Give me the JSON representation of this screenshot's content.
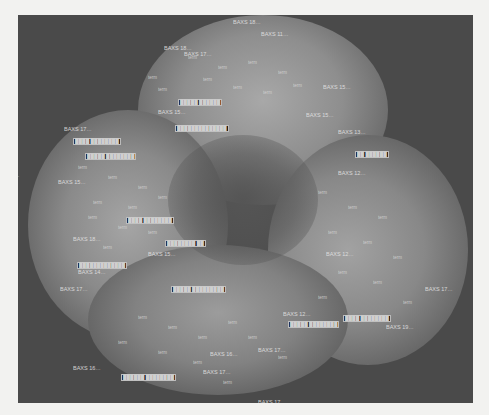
{
  "map": {
    "note": "Density/term map. Label text is illegible at this resolution; strings below are approximate placeholders following the visible 'BAXS …' pattern, not verified transcriptions.",
    "colors": {
      "background": "#4a4a4a",
      "page": "#f2f2f0",
      "cloud": "#8a8a8a",
      "label": "#d8d8d8"
    },
    "labels": [
      {
        "t": "BAXS 18…",
        "x": 215,
        "y": 5,
        "big": true
      },
      {
        "t": "BAXS 11…",
        "x": 243,
        "y": 17,
        "big": true
      },
      {
        "t": "BAXS 18…",
        "x": 146,
        "y": 31,
        "big": true
      },
      {
        "t": "BAXS 17…",
        "x": 166,
        "y": 37,
        "big": true
      },
      {
        "t": "BAXS 17…",
        "x": 46,
        "y": 112,
        "big": true
      },
      {
        "t": "BAXS 15…",
        "x": 140,
        "y": 95,
        "big": true
      },
      {
        "t": "BAXS 15…",
        "x": 305,
        "y": 70,
        "big": true
      },
      {
        "t": "BAXS 15…",
        "x": 288,
        "y": 98,
        "big": true
      },
      {
        "t": "BAXS 13…",
        "x": 320,
        "y": 115,
        "big": true
      },
      {
        "t": "BAXS 12…",
        "x": 320,
        "y": 156,
        "big": true
      },
      {
        "t": "…",
        "x": -4,
        "y": 158,
        "big": true
      },
      {
        "t": "BAXS 15…",
        "x": 40,
        "y": 165,
        "big": true
      },
      {
        "t": "BAXS 18…",
        "x": 55,
        "y": 222,
        "big": true
      },
      {
        "t": "BAXS 15…",
        "x": 130,
        "y": 237,
        "big": true
      },
      {
        "t": "BAXS 14…",
        "x": 60,
        "y": 255,
        "big": true
      },
      {
        "t": "BAXS 17…",
        "x": 42,
        "y": 272,
        "big": true
      },
      {
        "t": "BAXS 12…",
        "x": 308,
        "y": 237,
        "big": true
      },
      {
        "t": "BAXS 12…",
        "x": 265,
        "y": 297,
        "big": true
      },
      {
        "t": "BAXS 19…",
        "x": 368,
        "y": 310,
        "big": true
      },
      {
        "t": "BAXS 17…",
        "x": 407,
        "y": 272,
        "big": true
      },
      {
        "t": "BAXS 16…",
        "x": 55,
        "y": 351,
        "big": true
      },
      {
        "t": "BAXS 16…",
        "x": 192,
        "y": 337,
        "big": true
      },
      {
        "t": "BAXS 17…",
        "x": 185,
        "y": 355,
        "big": true
      },
      {
        "t": "BAXS 17…",
        "x": 240,
        "y": 333,
        "big": true
      },
      {
        "t": "BAXS 17…",
        "x": 240,
        "y": 385,
        "big": true
      }
    ],
    "boxed_labels": [
      {
        "t": "█████ ██████",
        "x": 160,
        "y": 84
      },
      {
        "t": "██████████████",
        "x": 157,
        "y": 110
      },
      {
        "t": "████ ████████",
        "x": 55,
        "y": 123
      },
      {
        "t": "█████ ████████",
        "x": 67,
        "y": 138
      },
      {
        "t": "████ ████████",
        "x": 108,
        "y": 202
      },
      {
        "t": "████████ ██",
        "x": 147,
        "y": 225
      },
      {
        "t": "█████████████",
        "x": 59,
        "y": 247
      },
      {
        "t": "█████ █████████",
        "x": 153,
        "y": 271
      },
      {
        "t": "██ ██████",
        "x": 337,
        "y": 136
      },
      {
        "t": "████ ████████",
        "x": 325,
        "y": 300
      },
      {
        "t": "█████ ████████",
        "x": 270,
        "y": 306
      },
      {
        "t": "██████ ████████",
        "x": 103,
        "y": 359
      }
    ],
    "terms": [
      "term",
      "term",
      "term",
      "term",
      "term",
      "term",
      "term",
      "term",
      "term",
      "term",
      "term",
      "term",
      "term",
      "term",
      "term",
      "term",
      "term",
      "term",
      "term",
      "term",
      "term",
      "term",
      "term",
      "term",
      "term",
      "term",
      "term",
      "term",
      "term",
      "term",
      "term",
      "term",
      "term",
      "term",
      "term",
      "term",
      "term",
      "term",
      "term",
      "term"
    ]
  }
}
